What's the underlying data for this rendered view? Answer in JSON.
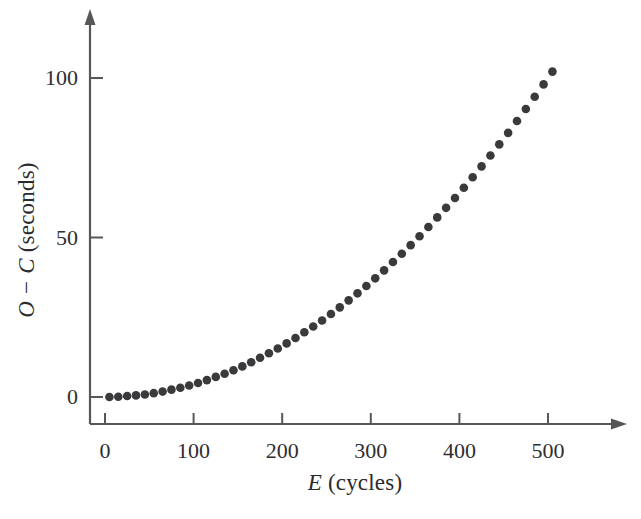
{
  "figure": {
    "background_color": "#ffffff",
    "axis_color": "#575759",
    "marker_color": "#3a3a3c",
    "text_color": "#2b2b2d"
  },
  "axis_titles": {
    "y_var_1": "O",
    "y_minus": "−",
    "y_var_2": "C",
    "y_units": "(seconds)",
    "y_full": "O − C (seconds)",
    "x_var": "E",
    "x_units": "(cycles)",
    "x_full": "E (cycles)"
  },
  "ticks": {
    "x_labels": [
      "0",
      "100",
      "200",
      "300",
      "400",
      "500"
    ],
    "y_labels": [
      "0",
      "50",
      "100"
    ]
  },
  "chart_data": {
    "type": "scatter",
    "title": "",
    "subtitle": "",
    "xlabel": "E (cycles)",
    "ylabel": "O - C (seconds)",
    "xlim": [
      0,
      510
    ],
    "ylim": [
      0,
      105
    ],
    "xticks": [
      0,
      100,
      200,
      300,
      400,
      500
    ],
    "yticks": [
      0,
      50,
      100
    ],
    "grid": false,
    "legend": null,
    "annotations": [],
    "marker": "filled-circle",
    "series": [
      {
        "name": "O-C residuals",
        "x": [
          5,
          15,
          25,
          35,
          45,
          55,
          65,
          75,
          85,
          95,
          105,
          115,
          125,
          135,
          145,
          155,
          165,
          175,
          185,
          195,
          205,
          215,
          225,
          235,
          245,
          255,
          265,
          275,
          285,
          295,
          305,
          315,
          325,
          335,
          345,
          355,
          365,
          375,
          385,
          395,
          405,
          415,
          425,
          435,
          445,
          455,
          465,
          475,
          485,
          495,
          505
        ],
        "y": [
          0.0,
          0.1,
          0.3,
          0.5,
          0.8,
          1.2,
          1.7,
          2.3,
          2.9,
          3.6,
          4.4,
          5.3,
          6.3,
          7.3,
          8.4,
          9.6,
          10.9,
          12.3,
          13.7,
          15.2,
          16.8,
          18.5,
          20.3,
          22.1,
          24.0,
          26.0,
          28.1,
          30.3,
          32.5,
          34.8,
          37.2,
          39.7,
          42.3,
          44.9,
          47.6,
          50.4,
          53.3,
          56.3,
          59.3,
          62.4,
          65.6,
          68.9,
          72.3,
          75.7,
          79.2,
          82.8,
          86.5,
          90.3,
          94.1,
          98.0,
          102.0
        ]
      }
    ],
    "fit_description": "O - C grows quadratically with E, approximately 4.0e-4 * E^2"
  }
}
